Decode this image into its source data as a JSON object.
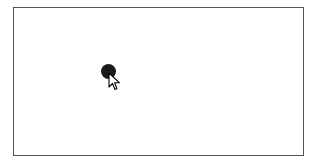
{
  "canvas": {
    "border_color": "#555555",
    "background": "#ffffff"
  },
  "dot": {
    "color": "#1a1a1a",
    "center_x": 108,
    "center_y": 71,
    "diameter": 15
  },
  "cursor": {
    "icon": "arrow-pointer-icon",
    "x": 108,
    "y": 72
  }
}
